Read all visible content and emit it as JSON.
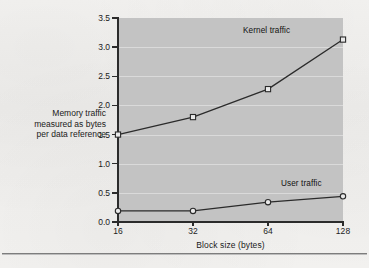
{
  "figure": {
    "background_color": "#f2f2f0",
    "plot_background_color": "#c3c3c3",
    "line_color": "#2b2b2b",
    "has_bottom_rule": true
  },
  "annotations": {
    "kernel_label": "Kernel traffic",
    "user_label": "User traffic"
  },
  "chart_data": {
    "type": "line",
    "title": "",
    "subtitle": "",
    "xlabel": "Block size (bytes)",
    "ylabel": "Memory traffic measured as bytes per data reference",
    "ylabel_lines": [
      "Memory traffic",
      "measured as bytes",
      "per data reference"
    ],
    "categories": [
      "16",
      "32",
      "64",
      "128"
    ],
    "x": [
      16,
      32,
      64,
      128
    ],
    "x_scale": "categorical-even",
    "xticklabels": [
      "16",
      "32",
      "64",
      "128"
    ],
    "yticklabels": [
      "0.0",
      "0.5",
      "1.0",
      "1.5",
      "2.0",
      "2.5",
      "3.0",
      "3.5"
    ],
    "yticks": [
      0.0,
      0.5,
      1.0,
      1.5,
      2.0,
      2.5,
      3.0,
      3.5
    ],
    "ylim": [
      0.0,
      3.5
    ],
    "grid": "horizontal",
    "legend": "inline-annotations",
    "series": [
      {
        "name": "Kernel traffic",
        "marker": "open-square",
        "values": [
          1.5,
          1.8,
          2.28,
          3.13
        ]
      },
      {
        "name": "User traffic",
        "marker": "open-circle",
        "values": [
          0.19,
          0.19,
          0.34,
          0.44
        ]
      }
    ]
  }
}
